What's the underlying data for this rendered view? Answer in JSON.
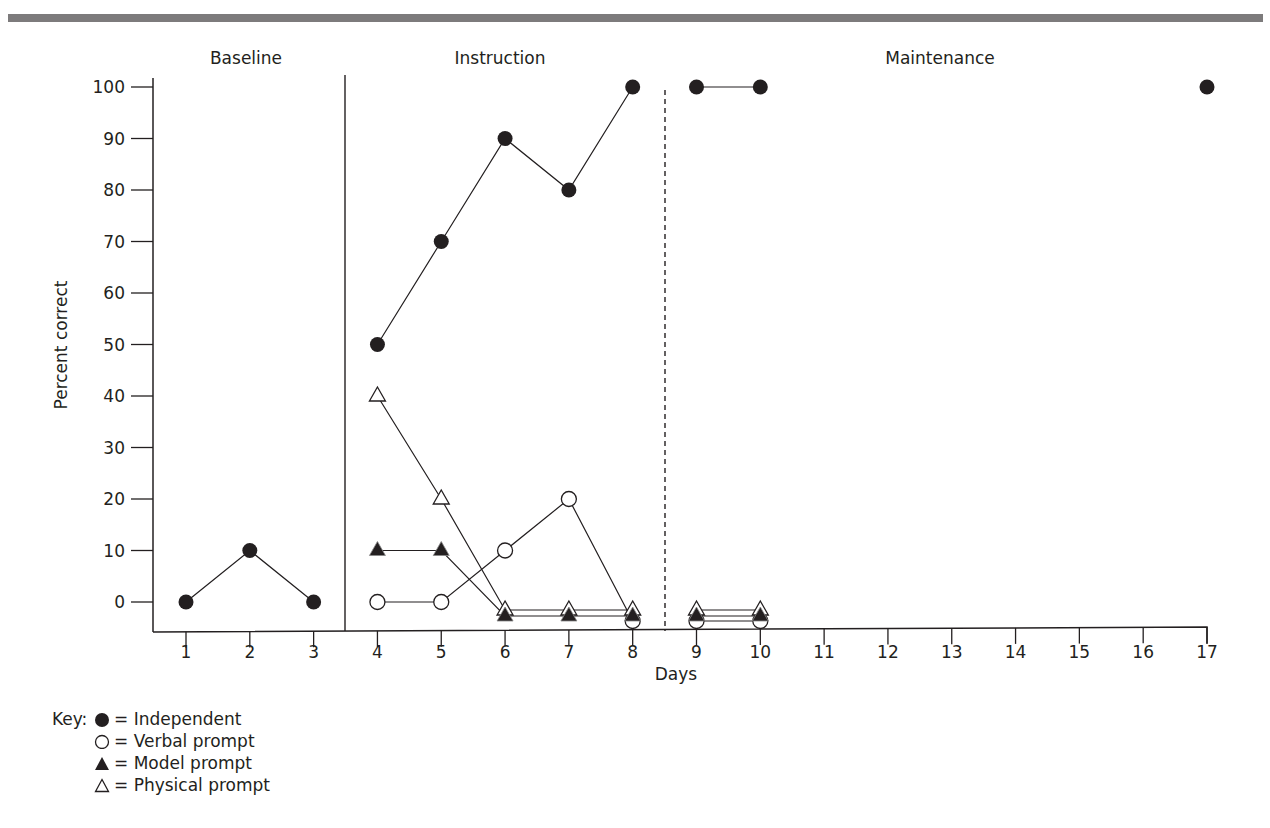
{
  "figure": {
    "phases": [
      {
        "label": "Baseline"
      },
      {
        "label": "Instruction"
      },
      {
        "label": "Maintenance"
      }
    ],
    "legend": {
      "prefix": "Key:",
      "items": [
        {
          "symbol": "filled-circle",
          "label": "= Independent"
        },
        {
          "symbol": "open-circle",
          "label": "= Verbal prompt"
        },
        {
          "symbol": "filled-triangle",
          "label": "= Model prompt"
        },
        {
          "symbol": "open-triangle",
          "label": "= Physical prompt"
        }
      ]
    },
    "colors": {
      "ink": "#231f20",
      "rule": "#7d7b7c",
      "background": "#ffffff"
    }
  },
  "chart_data": {
    "type": "line",
    "title": "",
    "xlabel": "Days",
    "ylabel": "Percent correct",
    "x_ticks": [
      1,
      2,
      3,
      4,
      5,
      6,
      7,
      8,
      9,
      10,
      11,
      12,
      13,
      14,
      15,
      16,
      17
    ],
    "y_ticks": [
      0,
      10,
      20,
      30,
      40,
      50,
      60,
      70,
      80,
      90,
      100
    ],
    "xlim": [
      0.5,
      17
    ],
    "ylim": [
      0,
      100
    ],
    "grid": false,
    "legend_position": "bottom-left",
    "phase_changes": [
      {
        "after_day": 3,
        "style": "solid",
        "from": "Baseline",
        "to": "Instruction"
      },
      {
        "after_day": 8,
        "style": "dashed",
        "from": "Instruction",
        "to": "Maintenance"
      }
    ],
    "series": [
      {
        "name": "Independent",
        "marker": "filled-circle",
        "segments": [
          {
            "x": [
              1,
              2,
              3
            ],
            "y": [
              0,
              10,
              0
            ]
          },
          {
            "x": [
              4,
              5,
              6,
              7,
              8
            ],
            "y": [
              50,
              70,
              90,
              80,
              100
            ]
          },
          {
            "x": [
              9,
              10
            ],
            "y": [
              100,
              100
            ]
          },
          {
            "x": [
              17
            ],
            "y": [
              100
            ]
          }
        ]
      },
      {
        "name": "Verbal prompt",
        "marker": "open-circle",
        "segments": [
          {
            "x": [
              4,
              5,
              6,
              7,
              8
            ],
            "y": [
              0,
              0,
              10,
              20,
              0
            ]
          },
          {
            "x": [
              9,
              10
            ],
            "y": [
              0,
              0
            ]
          }
        ]
      },
      {
        "name": "Model prompt",
        "marker": "filled-triangle",
        "segments": [
          {
            "x": [
              4,
              5,
              6,
              7,
              8
            ],
            "y": [
              10,
              10,
              0,
              0,
              0
            ]
          },
          {
            "x": [
              9,
              10
            ],
            "y": [
              0,
              0
            ]
          }
        ]
      },
      {
        "name": "Physical prompt",
        "marker": "open-triangle",
        "segments": [
          {
            "x": [
              4,
              5,
              6,
              7,
              8
            ],
            "y": [
              40,
              20,
              0,
              0,
              0
            ]
          },
          {
            "x": [
              9,
              10
            ],
            "y": [
              0,
              0
            ]
          }
        ]
      }
    ]
  }
}
